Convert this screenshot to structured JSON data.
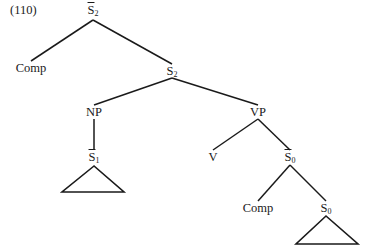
{
  "example_number": "(110)",
  "nodes": [
    {
      "id": "sbar2",
      "cat": "S",
      "sub": "2",
      "bar": true,
      "x": 93,
      "y": 3
    },
    {
      "id": "comp1",
      "cat": "Comp",
      "sub": "",
      "bar": false,
      "x": 31,
      "y": 61
    },
    {
      "id": "s2",
      "cat": "S",
      "sub": "2",
      "bar": false,
      "x": 172,
      "y": 64
    },
    {
      "id": "np",
      "cat": "NP",
      "sub": "",
      "bar": false,
      "x": 94,
      "y": 105
    },
    {
      "id": "vp",
      "cat": "VP",
      "sub": "",
      "bar": false,
      "x": 258,
      "y": 105
    },
    {
      "id": "sbar1",
      "cat": "S",
      "sub": "1",
      "bar": true,
      "x": 94,
      "y": 150
    },
    {
      "id": "v",
      "cat": "V",
      "sub": "",
      "bar": false,
      "x": 213,
      "y": 150
    },
    {
      "id": "sbar0",
      "cat": "S",
      "sub": "0",
      "bar": true,
      "x": 290,
      "y": 150
    },
    {
      "id": "comp2",
      "cat": "Comp",
      "sub": "",
      "bar": false,
      "x": 258,
      "y": 201
    },
    {
      "id": "s0",
      "cat": "S",
      "sub": "0",
      "bar": false,
      "x": 326,
      "y": 201
    }
  ],
  "edges": [
    [
      93,
      20,
      31,
      61
    ],
    [
      93,
      20,
      172,
      64
    ],
    [
      172,
      78,
      94,
      105
    ],
    [
      172,
      78,
      258,
      105
    ],
    [
      94,
      119,
      94,
      150
    ],
    [
      258,
      119,
      213,
      150
    ],
    [
      258,
      119,
      290,
      150
    ],
    [
      290,
      165,
      258,
      201
    ],
    [
      290,
      165,
      326,
      201
    ]
  ],
  "triangles": [
    [
      94,
      166,
      62,
      192,
      124,
      192
    ],
    [
      326,
      216,
      296,
      244,
      358,
      244
    ]
  ]
}
